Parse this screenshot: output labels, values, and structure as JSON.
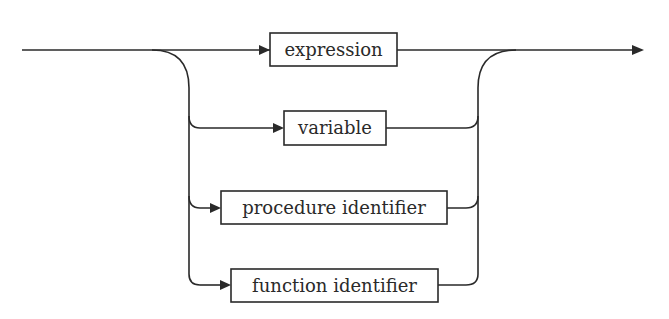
{
  "diagram": {
    "type": "syntax-diagram",
    "alternatives": [
      {
        "label": "expression"
      },
      {
        "label": "variable"
      },
      {
        "label": "procedure identifier"
      },
      {
        "label": "function identifier"
      }
    ],
    "colors": {
      "stroke": "#2a2a2a",
      "background": "#ffffff"
    }
  }
}
